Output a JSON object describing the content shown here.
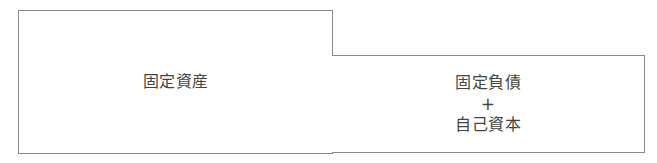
{
  "diagram": {
    "type": "balance-sheet-comparison",
    "left_box": {
      "label": "固定資産"
    },
    "right_box": {
      "lines": [
        "固定負債",
        "+",
        "自己資本"
      ]
    },
    "colors": {
      "border": "#8a8a8a",
      "text": "#444444",
      "background": "#ffffff"
    }
  }
}
